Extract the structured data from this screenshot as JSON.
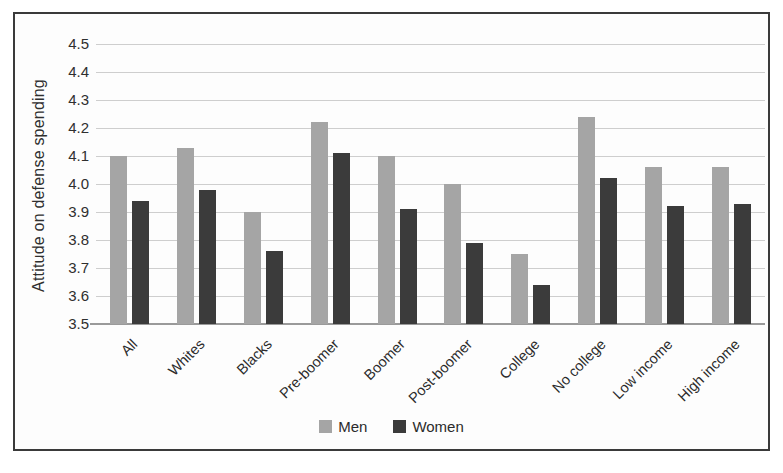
{
  "chart_data": {
    "type": "bar",
    "title": "",
    "xlabel": "",
    "ylabel": "Attitude on defense spending",
    "ylim": [
      3.5,
      4.5
    ],
    "ytick_step": 0.1,
    "yticks": [
      "4.5",
      "4.4",
      "4.3",
      "4.2",
      "4.1",
      "4.0",
      "3.9",
      "3.8",
      "3.7",
      "3.6",
      "3.5"
    ],
    "grid": true,
    "legend_position": "bottom",
    "categories": [
      "All",
      "Whites",
      "Blacks",
      "Pre-boomer",
      "Boomer",
      "Post-boomer",
      "College",
      "No college",
      "Low income",
      "High income"
    ],
    "series": [
      {
        "name": "Men",
        "color": "#a5a5a5",
        "values": [
          4.1,
          4.13,
          3.9,
          4.22,
          4.1,
          4.0,
          3.75,
          4.24,
          4.06,
          4.06
        ]
      },
      {
        "name": "Women",
        "color": "#3b3b3b",
        "values": [
          3.94,
          3.98,
          3.76,
          4.11,
          3.91,
          3.79,
          3.64,
          4.02,
          3.92,
          3.93
        ]
      }
    ]
  }
}
